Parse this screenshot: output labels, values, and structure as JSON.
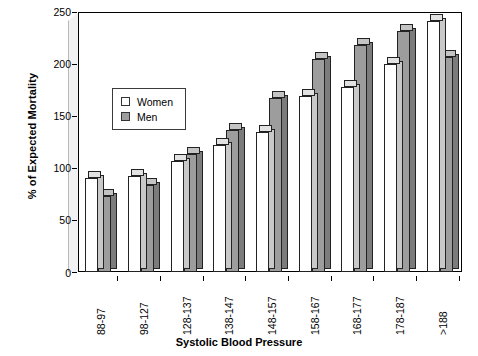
{
  "chart_data": {
    "type": "bar",
    "title": "",
    "xlabel": "Systolic Blood Pressure",
    "ylabel": "% of Expected Mortality",
    "ylim": [
      0,
      250
    ],
    "yticks": [
      0,
      50,
      100,
      150,
      200,
      250
    ],
    "grid": false,
    "legend_position": "upper-left-inside",
    "categories": [
      "88-97",
      "98-127",
      "128-137",
      "138-147",
      "148-157",
      "158-167",
      "168-177",
      "178-187",
      ">188"
    ],
    "series": [
      {
        "name": "Women",
        "color": "#ffffff",
        "values": [
          90,
          92,
          107,
          122,
          135,
          169,
          178,
          200,
          241
        ]
      },
      {
        "name": "Men",
        "color": "#9d9d9d",
        "values": [
          73,
          84,
          113,
          137,
          167,
          205,
          218,
          232,
          207
        ]
      }
    ]
  },
  "legend": {
    "items": [
      {
        "label": "Women",
        "swatch": "empty-square-icon"
      },
      {
        "label": "Men",
        "swatch": "filled-square-icon"
      }
    ]
  }
}
